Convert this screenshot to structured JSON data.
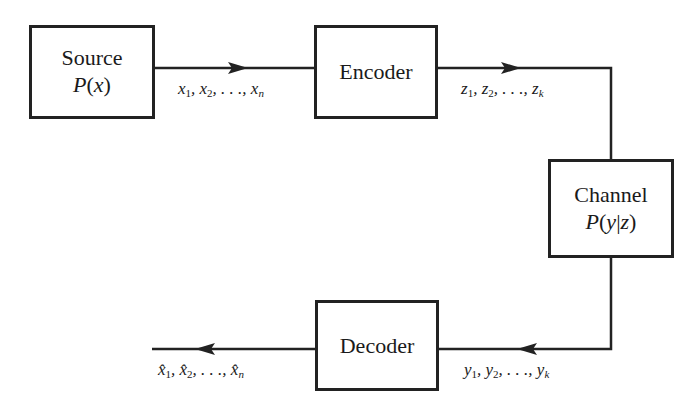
{
  "diagram": {
    "type": "communication-system-block-diagram",
    "blocks": {
      "source": {
        "title": "Source",
        "prob": "P(x)"
      },
      "encoder": {
        "title": "Encoder"
      },
      "channel": {
        "title": "Channel",
        "prob": "P(y|z)"
      },
      "decoder": {
        "title": "Decoder"
      }
    },
    "signals": {
      "source_to_encoder": {
        "var": "x",
        "subs": [
          "1",
          "2",
          "n"
        ],
        "text": "x1, x2, . . ., xn"
      },
      "encoder_to_channel": {
        "var": "z",
        "subs": [
          "1",
          "2",
          "k"
        ],
        "text": "z1, z2, . . ., zk"
      },
      "channel_to_decoder": {
        "var": "y",
        "subs": [
          "1",
          "2",
          "k"
        ],
        "text": "y1, y2, . . ., yk"
      },
      "decoder_output": {
        "var": "x̂",
        "subs": [
          "1",
          "2",
          "n"
        ],
        "text": "x̂1, x̂2, . . ., x̂n"
      }
    },
    "separator": ", ",
    "ellipsis": ". . .,",
    "colors": {
      "line": "#222222",
      "background": "#ffffff"
    }
  }
}
